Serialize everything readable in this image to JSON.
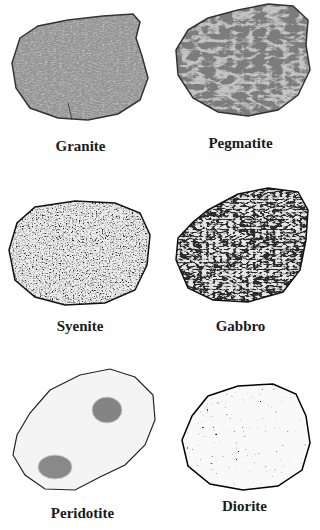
{
  "figure": {
    "rocks": [
      {
        "name": "Granite"
      },
      {
        "name": "Pegmatite"
      },
      {
        "name": "Syenite"
      },
      {
        "name": "Gabbro"
      },
      {
        "name": "Peridotite"
      },
      {
        "name": "Diorite"
      }
    ]
  }
}
